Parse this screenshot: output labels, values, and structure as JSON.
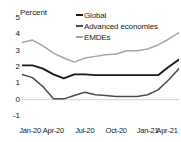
{
  "chart_data": {
    "type": "line",
    "title": "",
    "ylabel": "Percent",
    "xlabel": "",
    "ylim": [
      -1,
      5
    ],
    "yticks": [
      5,
      4,
      3,
      2,
      1,
      0,
      -1
    ],
    "ytick_labels": [
      "5",
      "4",
      "3",
      "2",
      "1",
      "0",
      "-1"
    ],
    "grid": false,
    "zero_line": true,
    "legend_position": "top-right",
    "x": [
      "Jan-20",
      "Feb-20",
      "Mar-20",
      "Apr-20",
      "May-20",
      "Jun-20",
      "Jul-20",
      "Aug-20",
      "Sep-20",
      "Oct-20",
      "Nov-20",
      "Dec-20",
      "Jan-21",
      "Feb-21",
      "Mar-21",
      "Apr-21"
    ],
    "xtick_labels": [
      "Jan-20",
      "Apr-20",
      "Jul-20",
      "Oct-20",
      "Jan-21",
      "Apr-21"
    ],
    "series": [
      {
        "name": "Global",
        "color": "#1a1a1a",
        "values": [
          2.1,
          2.1,
          1.9,
          1.55,
          1.3,
          1.55,
          1.55,
          1.5,
          1.5,
          1.5,
          1.5,
          1.5,
          1.5,
          1.5,
          2.0,
          2.45
        ]
      },
      {
        "name": "Advanced economies",
        "color": "#4d4d4d",
        "values": [
          1.55,
          1.35,
          0.8,
          0.05,
          0.05,
          0.25,
          0.45,
          0.3,
          0.25,
          0.2,
          0.2,
          0.2,
          0.3,
          0.6,
          1.2,
          1.9
        ]
      },
      {
        "name": "EMDEs",
        "color": "#a6a6a6",
        "values": [
          3.5,
          3.65,
          3.3,
          2.85,
          2.55,
          2.3,
          2.55,
          2.65,
          2.75,
          2.8,
          3.0,
          3.0,
          3.1,
          3.35,
          3.7,
          4.1
        ]
      }
    ]
  },
  "legend": {
    "items": [
      {
        "label": "Global",
        "color": "#1a1a1a"
      },
      {
        "label": "Advanced economies",
        "color": "#4d4d4d"
      },
      {
        "label": "EMDEs",
        "color": "#a6a6a6"
      }
    ]
  },
  "colors": {
    "global": "#1a1a1a",
    "advanced_economies": "#4d4d4d",
    "emdes": "#a6a6a6",
    "zero_line": "#d9d9d9",
    "background": "#ffffff",
    "text": "#1a1a1a"
  }
}
